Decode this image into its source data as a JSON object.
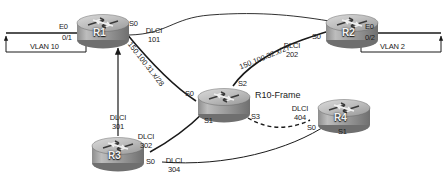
{
  "diagram": {
    "type": "network-topology",
    "colors": {
      "link": "#1a1a1a",
      "router_body": "#9a9a9a",
      "router_top": "#c9c9c9",
      "background": "#ffffff",
      "text": "#1a1a1a"
    }
  },
  "routers": [
    {
      "id": "r1",
      "name": "R1",
      "icon": "router-icon"
    },
    {
      "id": "r2",
      "name": "R2",
      "icon": "router-icon"
    },
    {
      "id": "r10",
      "name": "R10-Frame",
      "icon": "router-icon"
    },
    {
      "id": "r3",
      "name": "R3",
      "icon": "router-icon"
    },
    {
      "id": "r4",
      "name": "R4",
      "icon": "router-icon"
    }
  ],
  "interfaces": {
    "r1_e0": "E0",
    "r1_e0_sub": "0/1",
    "r1_s0": "S0",
    "r2_e0": "E0",
    "r2_e0_sub": "0/2",
    "r2_s0": "S0",
    "r10_s0": "S0",
    "r10_s1": "S1",
    "r10_s2": "S2",
    "r10_s3": "S3",
    "r3_s0": "S0",
    "r4_s0": "S0",
    "r4_s1": "S1"
  },
  "vlans": [
    {
      "id": "vlan10",
      "label": "VLAN 10"
    },
    {
      "id": "vlan2",
      "label": "VLAN 2"
    }
  ],
  "dlci_labels": [
    {
      "id": "dlci101",
      "title": "DLCI",
      "value": "101"
    },
    {
      "id": "dlci202",
      "title": "DLCI",
      "value": "202"
    },
    {
      "id": "dlci301",
      "title": "DLCI",
      "value": "301"
    },
    {
      "id": "dlci302",
      "title": "DLCI",
      "value": "302"
    },
    {
      "id": "dlci304",
      "title": "DLCI",
      "value": "304"
    },
    {
      "id": "dlci404",
      "title": "DLCI",
      "value": "404"
    }
  ],
  "subnets": [
    {
      "id": "subnet31",
      "label": "150.100.31.x/28"
    },
    {
      "id": "subnet32",
      "label": "150.100.32.x/27"
    }
  ]
}
